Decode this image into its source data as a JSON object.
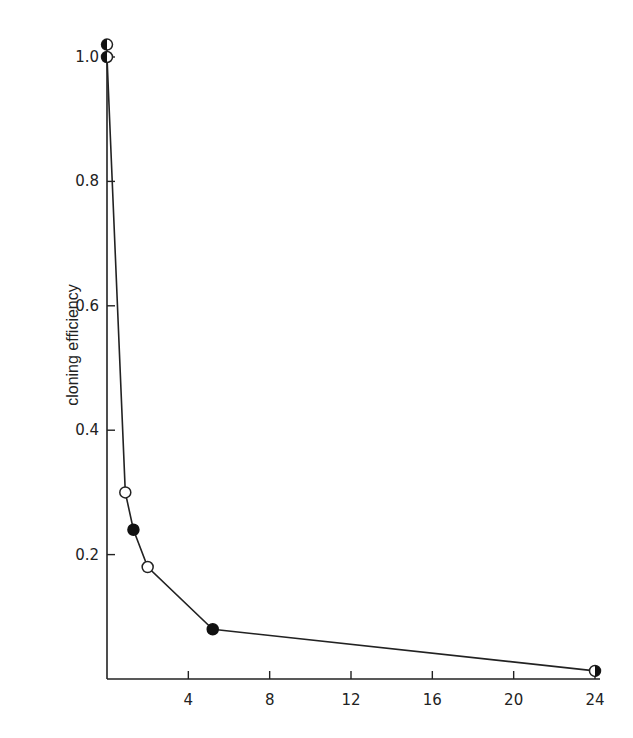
{
  "chart_data": {
    "type": "line",
    "title": "",
    "xlabel": "",
    "ylabel": "cloning efficiency",
    "xlim": [
      0,
      24
    ],
    "ylim": [
      0,
      1.0
    ],
    "x_ticks": [
      4,
      8,
      12,
      16,
      20,
      24
    ],
    "x_tick_labels": [
      "4",
      "8",
      "12",
      "16",
      "20",
      "24"
    ],
    "y_ticks": [
      0.2,
      0.4,
      0.6,
      0.8,
      1.0
    ],
    "y_tick_labels": [
      "0.2",
      "0.4",
      "0.6",
      "0.8",
      "1.0"
    ],
    "grid": false,
    "legend": null,
    "series": [
      {
        "name": "cloning efficiency",
        "points": [
          {
            "x": 0,
            "y": 1.02,
            "marker": "half-filled"
          },
          {
            "x": 0,
            "y": 1.0,
            "marker": "half-filled"
          },
          {
            "x": 0.9,
            "y": 0.3,
            "marker": "open"
          },
          {
            "x": 1.3,
            "y": 0.24,
            "marker": "filled"
          },
          {
            "x": 2.0,
            "y": 0.18,
            "marker": "open"
          },
          {
            "x": 5.2,
            "y": 0.08,
            "marker": "filled"
          },
          {
            "x": 24,
            "y": 0.013,
            "marker": "half-filled"
          }
        ]
      }
    ]
  }
}
